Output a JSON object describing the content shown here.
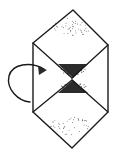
{
  "figure": {
    "title": "Folding step diagram",
    "canvas": {
      "width": 114,
      "height": 160
    },
    "colors": {
      "background": "#ffffff",
      "ink": "#1a1a1a",
      "stipple": "#2b2b2b",
      "arrow": "#2a2a2a"
    },
    "stroke_widths": {
      "outline": 1.4,
      "crease": 1.3,
      "arrow": 1.4
    }
  },
  "geometry": {
    "outer_hexagon": {
      "name": "outer-hexagon",
      "points": [
        [
          73,
          10
        ],
        [
          108,
          45
        ],
        [
          108,
          112
        ],
        [
          72,
          148
        ],
        [
          33,
          112
        ],
        [
          33,
          43
        ]
      ]
    },
    "upper_diamond": {
      "name": "upper-diamond",
      "points": [
        [
          73,
          10
        ],
        [
          108,
          45
        ],
        [
          72,
          78
        ],
        [
          33,
          43
        ]
      ]
    },
    "lower_diamond": {
      "name": "lower-diamond",
      "points": [
        [
          72,
          80
        ],
        [
          108,
          112
        ],
        [
          72,
          148
        ],
        [
          33,
          112
        ]
      ]
    },
    "left_vertical_edge": {
      "name": "left-vertical-edge",
      "from": [
        33,
        43
      ],
      "to": [
        33,
        112
      ]
    },
    "right_vertical_edge": {
      "name": "right-vertical-edge",
      "from": [
        108,
        45
      ],
      "to": [
        108,
        112
      ]
    },
    "crease_upper_left": {
      "name": "crease-upper-left",
      "from": [
        33,
        43
      ],
      "to": [
        72,
        78
      ]
    },
    "crease_upper_right": {
      "name": "crease-upper-right",
      "from": [
        108,
        45
      ],
      "to": [
        72,
        78
      ]
    },
    "crease_lower_left": {
      "name": "crease-lower-left",
      "from": [
        33,
        112
      ],
      "to": [
        72,
        80
      ]
    },
    "crease_lower_right": {
      "name": "crease-lower-right",
      "from": [
        108,
        112
      ],
      "to": [
        72,
        80
      ]
    },
    "hourglass": {
      "name": "hourglass-shape",
      "upper_triangle": [
        [
          58,
          64
        ],
        [
          88,
          64
        ],
        [
          73,
          78
        ]
      ],
      "lower_triangle": [
        [
          73,
          80
        ],
        [
          88,
          93
        ],
        [
          58,
          93
        ]
      ],
      "waist": [
        73,
        79
      ]
    },
    "arrow": {
      "name": "rotation-arrow",
      "path": "M 44 69 C 30 61 12 64 9 76 C 6 89 18 101 30 102",
      "head_tip": [
        47,
        70
      ],
      "head_points": [
        [
          47,
          70
        ],
        [
          38,
          66
        ],
        [
          39,
          75
        ]
      ],
      "direction": "right"
    },
    "stipple_regions": [
      {
        "name": "stipple-upper-panel",
        "cx": 72,
        "cy": 27,
        "rx": 20,
        "ry": 9,
        "density": 46,
        "dot_radius": 0.45
      },
      {
        "name": "stipple-lower-panel",
        "cx": 70,
        "cy": 126,
        "rx": 20,
        "ry": 9,
        "density": 42,
        "dot_radius": 0.45
      },
      {
        "name": "stipple-hourglass-upper",
        "cx": 73,
        "cy": 70,
        "rx": 13,
        "ry": 5,
        "density": 70,
        "dot_radius": 0.5
      },
      {
        "name": "stipple-hourglass-lower",
        "cx": 73,
        "cy": 87,
        "rx": 13,
        "ry": 5,
        "density": 66,
        "dot_radius": 0.5
      }
    ]
  },
  "labels": {
    "figure_alt": "Folding step diagram",
    "upper_panel": "upper diamond panel",
    "lower_panel": "lower diamond panel",
    "center_shape": "stippled hourglass",
    "motion_arrow": "fold rotation arrow"
  }
}
